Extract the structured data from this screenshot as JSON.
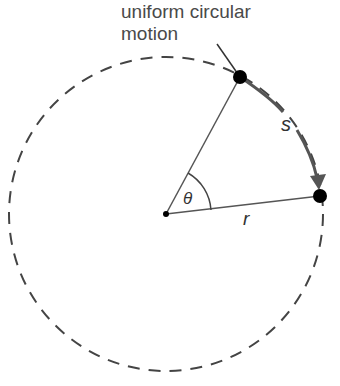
{
  "diagram": {
    "title_line1": "uniform circular",
    "title_line2": "motion",
    "arc_label": "s",
    "radius_label": "r",
    "angle_label": "θ",
    "colors": {
      "line": "#444444",
      "arc": "#555555",
      "dots": "#000000",
      "background": "#ffffff"
    },
    "geometry": {
      "center": [
        166,
        214
      ],
      "radius": 157,
      "point_start": [
        240,
        77
      ],
      "point_end": [
        320,
        196
      ]
    }
  }
}
